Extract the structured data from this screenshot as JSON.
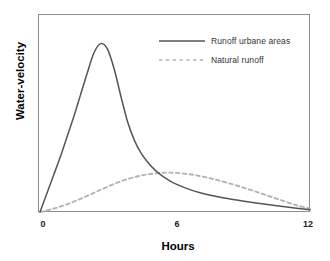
{
  "chart_data": {
    "type": "line",
    "title": "",
    "xlabel": "Hours",
    "ylabel": "Water-velocity",
    "xlim": [
      0,
      12
    ],
    "ylim": [
      0,
      1
    ],
    "xticks": [
      0,
      6,
      12
    ],
    "xtick_labels": [
      "0",
      "6",
      "12"
    ],
    "yticks": [],
    "ytick_labels": [],
    "grid": false,
    "frame": true,
    "legend_position": "upper right (inside axes)",
    "series": [
      {
        "name": "Runoff urbane areas",
        "style": "solid",
        "color": "#555555",
        "peak_x": 2.7,
        "peak_y": 0.92,
        "x": [
          0,
          0.3,
          0.6,
          0.9,
          1.2,
          1.5,
          1.8,
          2.1,
          2.4,
          2.7,
          3.0,
          3.3,
          3.6,
          3.9,
          4.2,
          4.5,
          4.8,
          5.1,
          5.4,
          5.7,
          6.0,
          6.6,
          7.2,
          7.8,
          8.4,
          9.0,
          9.6,
          10.2,
          10.8,
          11.4,
          12.0
        ],
        "y": [
          0.0,
          0.1,
          0.2,
          0.3,
          0.41,
          0.52,
          0.64,
          0.76,
          0.87,
          0.92,
          0.89,
          0.78,
          0.63,
          0.49,
          0.39,
          0.32,
          0.27,
          0.23,
          0.2,
          0.175,
          0.155,
          0.125,
          0.103,
          0.086,
          0.072,
          0.06,
          0.049,
          0.039,
          0.03,
          0.021,
          0.012
        ]
      },
      {
        "name": "Natural runoff",
        "style": "dashed",
        "color": "#b3b3b3",
        "peak_x": 5.7,
        "peak_y": 0.215,
        "x": [
          0,
          0.6,
          1.2,
          1.8,
          2.4,
          3.0,
          3.6,
          4.2,
          4.8,
          5.4,
          5.7,
          6.0,
          6.6,
          7.2,
          7.8,
          8.4,
          9.0,
          9.6,
          10.2,
          10.8,
          11.4,
          12.0
        ],
        "y": [
          0.0,
          0.018,
          0.042,
          0.072,
          0.105,
          0.138,
          0.168,
          0.191,
          0.206,
          0.214,
          0.215,
          0.214,
          0.207,
          0.194,
          0.177,
          0.157,
          0.135,
          0.111,
          0.086,
          0.061,
          0.037,
          0.018
        ]
      }
    ]
  },
  "axes": {
    "y_title": "Water-velocity",
    "x_title": "Hours",
    "x_ticks": [
      {
        "label": "0",
        "value": 0
      },
      {
        "label": "6",
        "value": 6
      },
      {
        "label": "12",
        "value": 12
      }
    ]
  },
  "legend": {
    "entries": [
      {
        "label": "Runoff urbane areas",
        "style": "solid",
        "color": "#555555"
      },
      {
        "label": "Natural runoff",
        "style": "dashed",
        "color": "#b3b3b3"
      }
    ]
  },
  "colors": {
    "background": "#ffffff",
    "frame": "#8c8c8c",
    "solid_series": "#555555",
    "dashed_series": "#b3b3b3",
    "text": "#000000"
  }
}
